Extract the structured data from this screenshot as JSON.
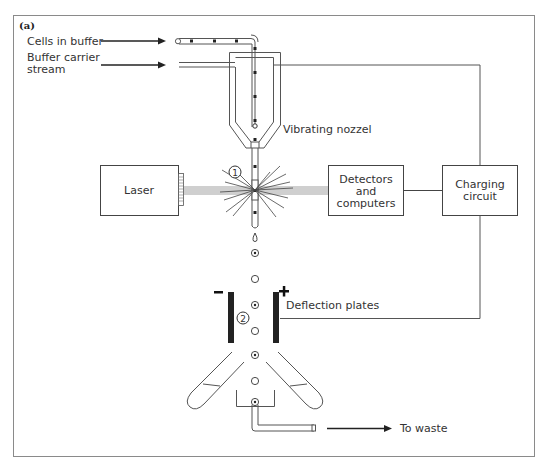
{
  "figure": {
    "panel_label": "(a)",
    "labels": {
      "cells_in_buffer": "Cells in buffer",
      "buffer_carrier_line1": "Buffer carrier",
      "buffer_carrier_line2": "stream",
      "vibrating_nozzle": "Vibrating nozzel",
      "laser": "Laser",
      "detectors_line1": "Detectors",
      "detectors_line2": "and",
      "detectors_line3": "computers",
      "charging_line1": "Charging",
      "charging_line2": "circuit",
      "deflection_plates": "Deflection plates",
      "to_waste": "To waste"
    },
    "markers": {
      "point1": "1",
      "point2": "2",
      "minus_sign": "−",
      "plus_sign": "+"
    },
    "colors": {
      "line": "#555555",
      "beam": "#cfcfcf",
      "plate": "#222222",
      "frame": "#888888"
    }
  }
}
